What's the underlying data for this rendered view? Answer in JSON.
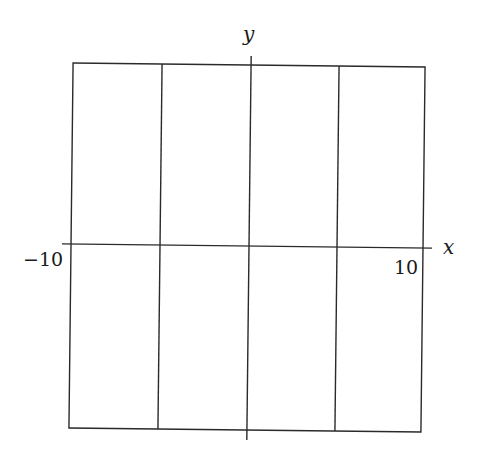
{
  "figure": {
    "type": "coordinate-grid",
    "axes": {
      "x": {
        "label": "x",
        "min_label": "−10",
        "max_label": "10",
        "min": -10,
        "max": 10
      },
      "y": {
        "label": "y"
      }
    },
    "grid": {
      "vertical_divisions": 4,
      "vertical_line_x_values": [
        -5,
        0,
        5
      ],
      "horizontal_divisions": 2
    },
    "colors": {
      "line": "#2a2a2a",
      "background": "#ffffff"
    }
  }
}
